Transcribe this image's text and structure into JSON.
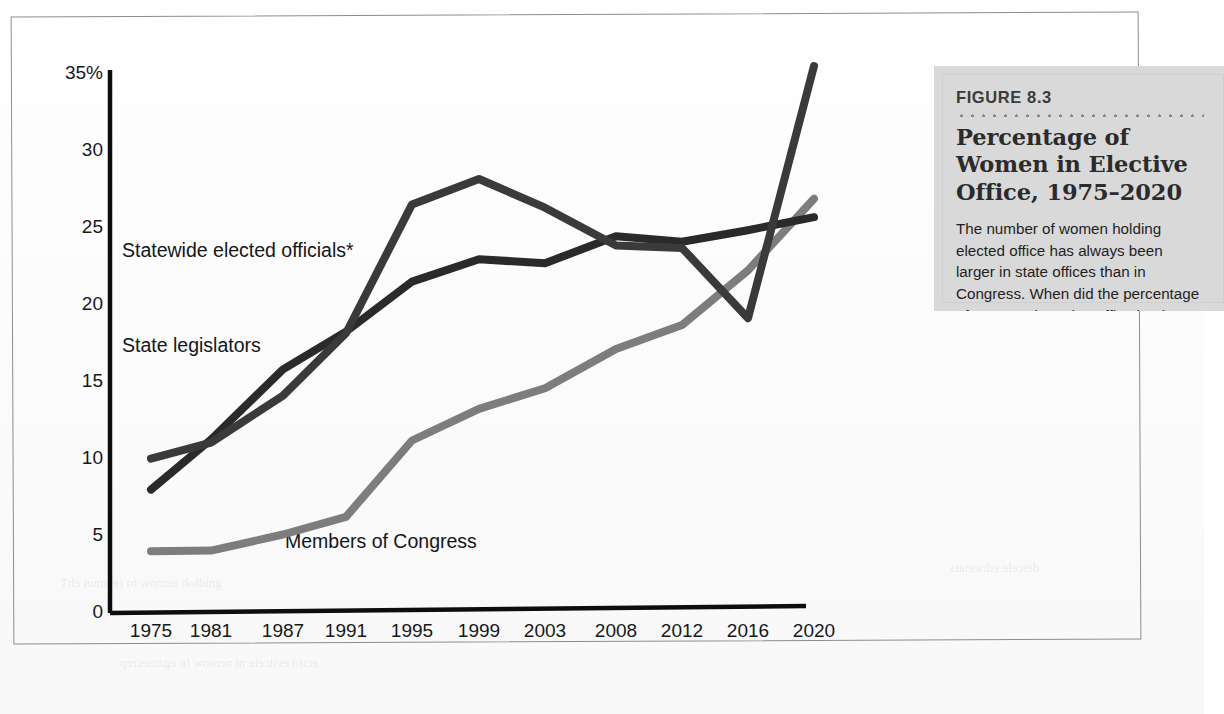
{
  "figure": {
    "number_label": "FIGURE 8.3",
    "title": "Percentage of Women in Elective Office, 1975–2020",
    "body": "The number of women holding elected office has always been larger in state offices than in Congress. When did the percentage of women elected to office begin to rise more rapidly?"
  },
  "chart_data": {
    "type": "line",
    "xlabel": "",
    "ylabel": "",
    "ylim": [
      0,
      35
    ],
    "yticks": [
      "0",
      "5",
      "10",
      "15",
      "20",
      "25",
      "30",
      "35%"
    ],
    "ytick_values": [
      0,
      5,
      10,
      15,
      20,
      25,
      30,
      35
    ],
    "grid": false,
    "legend": "inline-labels",
    "categories": [
      "1975",
      "1981",
      "1987",
      "1991",
      "1995",
      "1999",
      "2003",
      "2008",
      "2012",
      "2016",
      "2020"
    ],
    "x": [
      1975,
      1981,
      1987,
      1991,
      1995,
      1999,
      2003,
      2008,
      2012,
      2016,
      2020
    ],
    "series": [
      {
        "name": "Statewide elected officials*",
        "color": "#3a3a3a",
        "values": [
          10.0,
          11.0,
          14.0,
          18.0,
          26.3,
          27.9,
          26.0,
          23.5,
          23.3,
          18.7,
          35.0
        ]
      },
      {
        "name": "State legislators",
        "color": "#2a2a2a",
        "values": [
          8.0,
          11.2,
          15.7,
          18.1,
          21.3,
          22.7,
          22.4,
          24.1,
          23.7,
          24.4,
          25.2
        ]
      },
      {
        "name": "Members of Congress",
        "color": "#7d7d7d",
        "values": [
          4.0,
          4.0,
          5.0,
          6.1,
          11.0,
          13.0,
          14.3,
          16.8,
          18.3,
          21.8,
          26.4
        ]
      }
    ]
  },
  "axes": {
    "y_ticks": [
      {
        "label": "35%",
        "value": 35
      },
      {
        "label": "30",
        "value": 30
      },
      {
        "label": "25",
        "value": 25
      },
      {
        "label": "20",
        "value": 20
      },
      {
        "label": "15",
        "value": 15
      },
      {
        "label": "10",
        "value": 10
      },
      {
        "label": "5",
        "value": 5
      },
      {
        "label": "0",
        "value": 0
      }
    ],
    "x_ticks": [
      "1975",
      "1981",
      "1987",
      "1991",
      "1995",
      "1999",
      "2003",
      "2008",
      "2012",
      "2016",
      "2020"
    ]
  },
  "series_labels": {
    "statewide": "Statewide elected officials*",
    "legislators": "State legislators",
    "congress": "Members of Congress"
  },
  "colors": {
    "line_statewide": "#3a3a3a",
    "line_legislators": "#2a2a2a",
    "line_congress": "#7d7d7d",
    "axis": "#0d0d0d",
    "caption_bg": "#d9d9d9",
    "frame": "#8d8d8d"
  }
}
